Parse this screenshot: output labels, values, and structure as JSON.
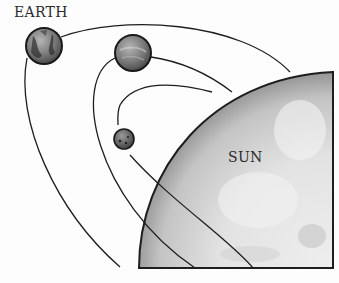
{
  "diagram": {
    "labels": {
      "earth": "EARTH",
      "sun": "SUN"
    },
    "bodies": [
      {
        "name": "Earth",
        "cx": 44,
        "cy": 46,
        "r": 18,
        "fill": "#6e6e6e"
      },
      {
        "name": "Venus",
        "cx": 133,
        "cy": 53,
        "r": 18,
        "fill": "#7b7b7b"
      },
      {
        "name": "Mercury",
        "cx": 124,
        "cy": 139,
        "r": 10,
        "fill": "#616161"
      }
    ],
    "sun": {
      "fill_outer": "#9a9a9a",
      "fill_inner": "#ececec",
      "stroke": "#1e1e1e"
    },
    "line_color": "#1e1e1e"
  }
}
